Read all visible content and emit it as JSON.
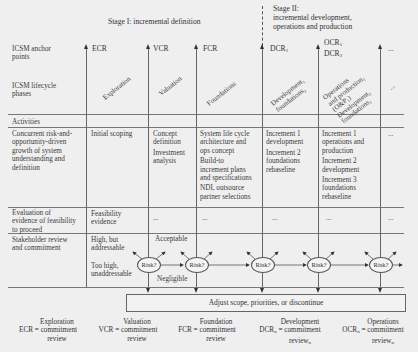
{
  "stages": {
    "stage1": "Stage I: incremental definition",
    "stage2_l1": "Stage II:",
    "stage2_l2": "incremental development,",
    "stage2_l3": "operations and production"
  },
  "row_labels": {
    "anchor_points": [
      "ICSM anchor",
      "points"
    ],
    "lifecycle_phases": [
      "ICSM lifecycle",
      "phases"
    ],
    "activities": "Activities",
    "concurrent": [
      "Concurrent risk-and-",
      "opportunity-driven",
      "growth of system",
      "understanding and",
      "definition"
    ],
    "evaluation": [
      "Evaluation of",
      "evidence of feasibility",
      "to proceed"
    ],
    "stakeholder": [
      "Stakeholder review",
      "and commitment"
    ]
  },
  "anchor_points": [
    {
      "label": "ECR"
    },
    {
      "label": "VCR"
    },
    {
      "label": "FCR"
    },
    {
      "label": "DCR",
      "sub": "1"
    },
    {
      "label1": "OCR",
      "sub1": "1",
      "label2": "DCR",
      "sub2": "2"
    },
    {
      "label": "..."
    }
  ],
  "phases": [
    {
      "lines": [
        "Exploration"
      ]
    },
    {
      "lines": [
        "Valuation"
      ]
    },
    {
      "lines": [
        "Foundations"
      ]
    },
    {
      "lines": [
        "Development₁",
        "foundations₂"
      ]
    },
    {
      "lines": [
        "Operations",
        "and production₁",
        "(O&P₁)",
        "Development₂",
        "foundations₃"
      ]
    },
    {
      "lines": [
        "..."
      ]
    }
  ],
  "concurrent_cells": [
    [
      "Initial scoping"
    ],
    [
      "Concept",
      "definition",
      "",
      "Investment",
      "analysis"
    ],
    [
      "System life cycle",
      "architecture and",
      "ops concept",
      "",
      "Build-to",
      "increment plans",
      "and specifications",
      "",
      "NDI, outsource",
      "partner selections"
    ],
    [
      "Increment 1",
      "development",
      "",
      "Increment 2",
      "foundations",
      "rebaseline"
    ],
    [
      "Increment 1",
      "operations and",
      "production",
      "",
      "Increment 2",
      "development",
      "",
      "Increment 3",
      "foundations",
      "rebaseline"
    ],
    [
      "..."
    ]
  ],
  "evaluation_cells": [
    [
      "Feasibility",
      "evidence"
    ],
    [
      "..."
    ],
    [
      "..."
    ],
    [
      "..."
    ],
    [
      "..."
    ],
    [
      "..."
    ]
  ],
  "stakeholder": {
    "high_but": [
      "High, but",
      "addressable"
    ],
    "too_high": [
      "Too high,",
      "unaddressable"
    ],
    "acceptable": "Acceptable",
    "negligible": "Negligible",
    "risk_label": "Risk?"
  },
  "adjust_box": "Adjust scope, priorities, or discontinue",
  "legend": [
    {
      "abbr": "ECR",
      "lines": [
        "Exploration",
        "commitment",
        "review"
      ]
    },
    {
      "abbr": "VCR",
      "lines": [
        "Valuation",
        "commitment",
        "review"
      ]
    },
    {
      "abbr": "FCR",
      "lines": [
        "Foundation",
        "commitment",
        "review"
      ]
    },
    {
      "abbr": "DCR",
      "abbr_sub": "n",
      "lines": [
        "Development",
        "commitment",
        "review"
      ],
      "last_sub": "n"
    },
    {
      "abbr": "OCR",
      "abbr_sub": "n",
      "lines": [
        "Operations",
        "commitment",
        "review"
      ],
      "last_sub": "n"
    }
  ],
  "equals": "="
}
